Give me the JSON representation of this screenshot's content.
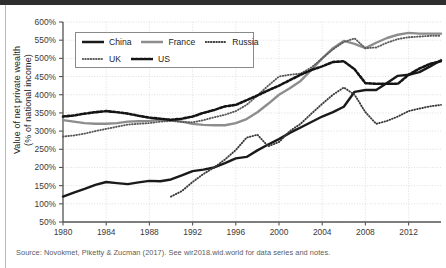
{
  "source": {
    "text": "Source: Novokmet, Piketty & Zucman (2017). See wir2018.wid.world for data series and notes.",
    "secondary": ""
  },
  "axis": {
    "ylabel_line1": "Value of net private wealth",
    "ylabel_line2": "(% of national income)"
  },
  "chart_data": {
    "type": "line",
    "title": "",
    "xlabel": "",
    "ylabel": "Value of net private wealth (% of national income)",
    "xlim": [
      1980,
      2015
    ],
    "ylim": [
      50,
      600
    ],
    "ytick_labels": [
      "600%",
      "550%",
      "500%",
      "450%",
      "400%",
      "350%",
      "300%",
      "250%",
      "200%",
      "150%",
      "100%",
      "50%"
    ],
    "ytick_values": [
      600,
      550,
      500,
      450,
      400,
      350,
      300,
      250,
      200,
      150,
      100,
      50
    ],
    "xtick_labels": [
      "1980",
      "1984",
      "1988",
      "1992",
      "1996",
      "2000",
      "2004",
      "2008",
      "2012"
    ],
    "xtick_values": [
      1980,
      1984,
      1988,
      1992,
      1996,
      2000,
      2004,
      2008,
      2012
    ],
    "grid": true,
    "legend_position": "top-left",
    "x": [
      1980,
      1981,
      1982,
      1983,
      1984,
      1985,
      1986,
      1987,
      1988,
      1989,
      1990,
      1991,
      1992,
      1993,
      1994,
      1995,
      1996,
      1997,
      1998,
      1999,
      2000,
      2001,
      2002,
      2003,
      2004,
      2005,
      2006,
      2007,
      2008,
      2009,
      2010,
      2011,
      2012,
      2013,
      2014,
      2015
    ],
    "series": [
      {
        "name": "China",
        "color": "#1a1a1a",
        "style": "solid-thick",
        "values": [
          120,
          131,
          141,
          152,
          160,
          157,
          154,
          159,
          163,
          162,
          167,
          178,
          190,
          194,
          200,
          212,
          225,
          229,
          247,
          263,
          278,
          295,
          310,
          325,
          340,
          352,
          367,
          408,
          413,
          413,
          432,
          452,
          455,
          462,
          478,
          495
        ]
      },
      {
        "name": "France",
        "color": "#8d8d8d",
        "style": "solid-thick",
        "values": [
          330,
          326,
          322,
          320,
          320,
          322,
          326,
          327,
          328,
          331,
          330,
          326,
          320,
          317,
          316,
          316,
          322,
          333,
          352,
          375,
          400,
          418,
          438,
          468,
          500,
          528,
          548,
          540,
          528,
          543,
          556,
          565,
          570,
          568,
          568,
          568
        ]
      },
      {
        "name": "Russia",
        "color": "#3a3a3a",
        "style": "dotted-fine",
        "values": [
          null,
          null,
          null,
          null,
          null,
          null,
          null,
          null,
          null,
          null,
          120,
          135,
          160,
          182,
          200,
          222,
          248,
          282,
          290,
          258,
          270,
          300,
          320,
          348,
          375,
          400,
          420,
          400,
          352,
          320,
          328,
          340,
          355,
          362,
          368,
          372
        ]
      },
      {
        "name": "UK",
        "color": "#5a5a5a",
        "style": "dotted-fine",
        "values": [
          285,
          288,
          293,
          300,
          306,
          312,
          318,
          320,
          322,
          326,
          328,
          325,
          324,
          330,
          338,
          345,
          355,
          372,
          398,
          425,
          450,
          455,
          458,
          475,
          500,
          525,
          545,
          555,
          528,
          530,
          543,
          553,
          558,
          560,
          562,
          562
        ]
      },
      {
        "name": "US",
        "color": "#141414",
        "style": "dotted-bold",
        "values": [
          340,
          343,
          348,
          352,
          355,
          352,
          348,
          342,
          337,
          334,
          331,
          334,
          340,
          350,
          358,
          368,
          372,
          385,
          398,
          412,
          425,
          440,
          455,
          468,
          478,
          490,
          492,
          470,
          432,
          430,
          430,
          430,
          455,
          472,
          485,
          492
        ]
      }
    ],
    "legend_entries": [
      {
        "label": "China",
        "style": "solid-thick",
        "color": "#1a1a1a"
      },
      {
        "label": "France",
        "style": "solid-thick",
        "color": "#8d8d8d"
      },
      {
        "label": "Russia",
        "style": "dotted-fine",
        "color": "#3a3a3a"
      },
      {
        "label": "UK",
        "style": "dotted-fine",
        "color": "#5a5a5a"
      },
      {
        "label": "US",
        "style": "dotted-bold",
        "color": "#141414"
      }
    ]
  }
}
